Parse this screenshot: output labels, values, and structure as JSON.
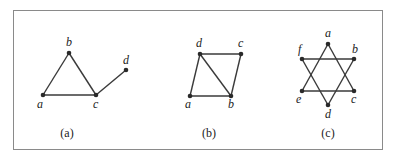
{
  "figure": {
    "graphs": [
      {
        "id": "a",
        "caption": "(a)",
        "caption_pos": [
          67,
          137
        ],
        "vertices": [
          {
            "name": "a",
            "x": 43,
            "y": 95,
            "lx": 37,
            "ly": 108
          },
          {
            "name": "b",
            "x": 69,
            "y": 53,
            "lx": 66,
            "ly": 46
          },
          {
            "name": "c",
            "x": 96,
            "y": 95,
            "lx": 93,
            "ly": 108
          },
          {
            "name": "d",
            "x": 126,
            "y": 70,
            "lx": 123,
            "ly": 64
          }
        ],
        "edges": [
          [
            "a",
            "b"
          ],
          [
            "b",
            "c"
          ],
          [
            "a",
            "c"
          ],
          [
            "c",
            "d"
          ]
        ]
      },
      {
        "id": "b",
        "caption": "(b)",
        "caption_pos": [
          209,
          137
        ],
        "vertices": [
          {
            "name": "a",
            "x": 190,
            "y": 96,
            "lx": 185,
            "ly": 108
          },
          {
            "name": "b",
            "x": 231,
            "y": 96,
            "lx": 228,
            "ly": 108
          },
          {
            "name": "c",
            "x": 241,
            "y": 54,
            "lx": 238,
            "ly": 47
          },
          {
            "name": "d",
            "x": 200,
            "y": 54,
            "lx": 196,
            "ly": 47
          }
        ],
        "edges": [
          [
            "a",
            "b"
          ],
          [
            "a",
            "d"
          ],
          [
            "d",
            "c"
          ],
          [
            "c",
            "b"
          ],
          [
            "d",
            "b"
          ]
        ]
      },
      {
        "id": "c",
        "caption": "(c)",
        "caption_pos": [
          328,
          137
        ],
        "vertices": [
          {
            "name": "a",
            "x": 328,
            "y": 44,
            "lx": 325,
            "ly": 37
          },
          {
            "name": "b",
            "x": 354,
            "y": 59,
            "lx": 352,
            "ly": 53
          },
          {
            "name": "c",
            "x": 354,
            "y": 91,
            "lx": 351,
            "ly": 103
          },
          {
            "name": "d",
            "x": 328,
            "y": 105,
            "lx": 325,
            "ly": 118
          },
          {
            "name": "e",
            "x": 302,
            "y": 91,
            "lx": 296,
            "ly": 103
          },
          {
            "name": "f",
            "x": 302,
            "y": 59,
            "lx": 298,
            "ly": 53
          }
        ],
        "edges": [
          [
            "a",
            "e"
          ],
          [
            "e",
            "c"
          ],
          [
            "c",
            "a"
          ],
          [
            "f",
            "b"
          ],
          [
            "b",
            "d"
          ],
          [
            "d",
            "f"
          ]
        ]
      }
    ]
  }
}
